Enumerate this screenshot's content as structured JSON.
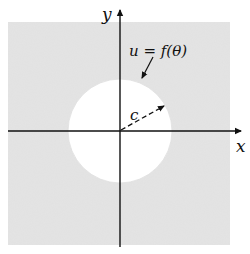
{
  "diagram": {
    "type": "geometric-figure",
    "axes": {
      "x_label": "x",
      "y_label": "y"
    },
    "region": {
      "shaded_color": "#e4e4e4",
      "hole_color": "#ffffff"
    },
    "boundary_label": "u = f(θ)",
    "radius_label": "c",
    "colors": {
      "ink": "#111111",
      "background": "#ffffff"
    }
  }
}
